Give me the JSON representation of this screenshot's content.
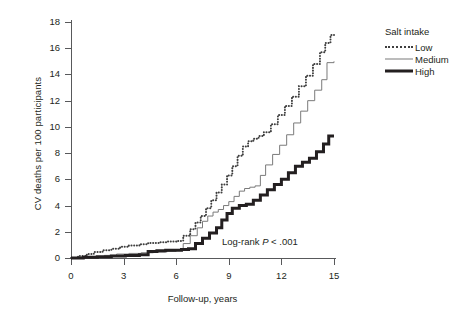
{
  "chart_data": {
    "type": "line",
    "title": "",
    "xlabel": "Follow-up, years",
    "ylabel": "CV deaths per 100 participants",
    "xlim": [
      0,
      15
    ],
    "ylim": [
      0,
      18
    ],
    "xticks": [
      0,
      3,
      6,
      9,
      12,
      15
    ],
    "yticks": [
      0,
      2,
      4,
      6,
      8,
      10,
      12,
      14,
      16,
      18
    ],
    "grid": false,
    "step": "post",
    "legend": {
      "position": "right",
      "title": "Salt intake",
      "entries": [
        {
          "name": "Low",
          "style": "dotted",
          "color": "#3f3f3f",
          "width": 2
        },
        {
          "name": "Medium",
          "style": "solid",
          "color": "#7a7a7a",
          "width": 1
        },
        {
          "name": "High",
          "style": "solid",
          "color": "#231f20",
          "width": 3
        }
      ]
    },
    "annotations": [
      {
        "text_before": "Log-rank ",
        "italic": "P",
        "text_after": " < .001",
        "x": 8.6,
        "y": 1.7
      }
    ],
    "series": [
      {
        "name": "Low",
        "x": [
          0,
          0.4,
          0.9,
          1.3,
          1.8,
          2.3,
          2.8,
          3.3,
          3.9,
          4.4,
          5.0,
          5.5,
          6.0,
          6.4,
          6.8,
          7.1,
          7.4,
          7.7,
          8.0,
          8.3,
          8.6,
          8.9,
          9.2,
          9.5,
          9.8,
          10.1,
          10.4,
          10.7,
          11.0,
          11.4,
          11.8,
          12.2,
          12.6,
          13.0,
          13.4,
          13.8,
          14.2,
          14.5,
          14.8,
          15.0
        ],
        "y": [
          0.0,
          0.15,
          0.3,
          0.45,
          0.6,
          0.7,
          0.85,
          0.95,
          1.05,
          1.15,
          1.2,
          1.25,
          1.3,
          1.7,
          2.2,
          2.7,
          3.2,
          3.8,
          4.4,
          5.0,
          5.6,
          6.3,
          7.0,
          7.8,
          8.5,
          8.9,
          9.1,
          9.3,
          9.6,
          10.2,
          10.9,
          11.6,
          12.3,
          13.1,
          13.9,
          14.8,
          15.7,
          16.4,
          17.0,
          17.2
        ]
      },
      {
        "name": "Medium",
        "x": [
          0,
          0.6,
          1.2,
          1.9,
          2.6,
          3.3,
          4.0,
          4.7,
          5.4,
          6.0,
          6.4,
          6.8,
          7.2,
          7.5,
          7.8,
          8.1,
          8.4,
          8.7,
          9.0,
          9.3,
          9.6,
          9.9,
          10.2,
          10.5,
          10.8,
          11.1,
          11.5,
          11.9,
          12.3,
          12.7,
          13.1,
          13.5,
          13.9,
          14.3,
          14.6,
          15.0
        ],
        "y": [
          0.0,
          0.05,
          0.1,
          0.2,
          0.3,
          0.35,
          0.4,
          0.45,
          0.5,
          0.6,
          1.1,
          1.7,
          2.3,
          2.8,
          3.2,
          3.5,
          3.7,
          4.0,
          4.3,
          4.7,
          5.1,
          5.3,
          5.4,
          5.5,
          6.3,
          7.1,
          7.9,
          8.6,
          9.4,
          10.3,
          11.2,
          12.0,
          12.8,
          13.6,
          14.9,
          15.0
        ]
      },
      {
        "name": "High",
        "x": [
          0,
          0.7,
          1.5,
          2.3,
          3.1,
          3.9,
          4.4,
          4.9,
          5.4,
          5.9,
          6.3,
          6.7,
          7.1,
          7.5,
          7.9,
          8.3,
          8.6,
          8.9,
          9.2,
          9.6,
          10.0,
          10.4,
          10.8,
          11.2,
          11.6,
          12.0,
          12.4,
          12.8,
          13.2,
          13.6,
          14.0,
          14.4,
          14.7,
          15.0
        ],
        "y": [
          0.0,
          0.05,
          0.1,
          0.15,
          0.2,
          0.25,
          0.5,
          0.55,
          0.6,
          0.6,
          0.65,
          0.7,
          1.1,
          1.5,
          1.9,
          2.3,
          2.9,
          3.4,
          3.8,
          4.0,
          4.1,
          4.4,
          4.8,
          5.2,
          5.6,
          6.0,
          6.5,
          7.0,
          7.3,
          7.6,
          8.1,
          8.7,
          9.3,
          9.3
        ]
      }
    ]
  },
  "watermark": {
    "text": ""
  }
}
